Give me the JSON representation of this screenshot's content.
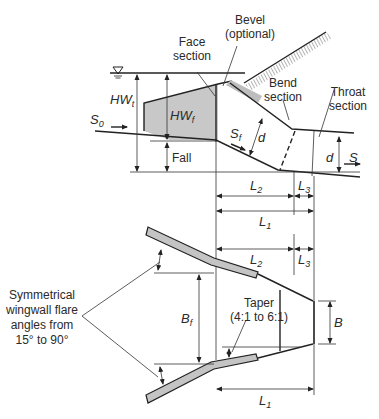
{
  "profile_view": {
    "labels": {
      "bevel_line1": "Bevel",
      "bevel_line2": "(optional)",
      "face_line1": "Face",
      "face_line2": "section",
      "bend_line1": "Bend",
      "bend_line2": "section",
      "throat_line1": "Throat",
      "throat_line2": "section",
      "hwt_main": "HW",
      "hwt_sub": "t",
      "hwf_main": "HW",
      "hwf_sub": "f",
      "s0_main": "S",
      "s0_sub": "0",
      "sf_main": "S",
      "sf_sub": "f",
      "d_bend": "d",
      "d_throat": "d",
      "s": "S",
      "fall": "Fall"
    }
  },
  "dimensions": {
    "l2_top_main": "L",
    "l2_top_sub": "2",
    "l3_top_main": "L",
    "l3_top_sub": "3",
    "l1_top_main": "L",
    "l1_top_sub": "1",
    "l2_plan_main": "L",
    "l2_plan_sub": "2",
    "l3_plan_main": "L",
    "l3_plan_sub": "3",
    "l1_bottom_main": "L",
    "l1_bottom_sub": "1"
  },
  "plan_view": {
    "labels": {
      "flare_line1": "Symmetrical",
      "flare_line2": "wingwall flare",
      "flare_line3": "angles from",
      "flare_line4": "15° to 90°",
      "bf_main": "B",
      "bf_sub": "f",
      "taper_line1": "Taper",
      "taper_line2": "(4:1 to 6:1)",
      "b": "B"
    }
  },
  "colors": {
    "line": "#222222",
    "fill_gray": "#c4c4c4",
    "text": "#2a2a2a"
  }
}
